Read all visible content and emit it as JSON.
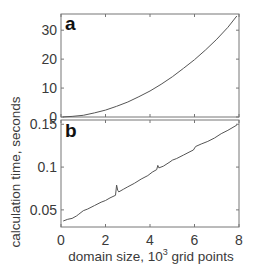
{
  "chart_data": [
    {
      "type": "line",
      "panel": "a",
      "title": "",
      "xlabel": "domain size, 10^3 grid points",
      "ylabel": "calculation time, seconds",
      "xlim": [
        0,
        8
      ],
      "ylim": [
        0,
        35.6
      ],
      "xticks": [
        0,
        2,
        4,
        6,
        8
      ],
      "yticks": [
        0,
        10,
        20,
        30
      ],
      "ytick_labels": [
        "0",
        "10",
        "20",
        "30"
      ],
      "grid": false,
      "series": [
        {
          "name": "calculation time",
          "x": [
            0.1,
            0.5,
            1,
            1.5,
            2,
            2.5,
            3,
            3.5,
            4,
            4.5,
            5,
            5.5,
            6,
            6.5,
            7,
            7.5,
            7.9
          ],
          "y": [
            0.05,
            0.2,
            0.6,
            1.4,
            2.4,
            3.7,
            5.2,
            7.0,
            9.0,
            11.3,
            13.9,
            16.8,
            19.8,
            23.2,
            26.9,
            31.0,
            34.9
          ]
        }
      ]
    },
    {
      "type": "line",
      "panel": "b",
      "title": "",
      "xlabel": "domain size, 10^3 grid points",
      "ylabel": "calculation time, seconds",
      "xlim": [
        0,
        8
      ],
      "ylim": [
        0.03,
        0.155
      ],
      "xticks": [
        0,
        2,
        4,
        6,
        8
      ],
      "xtick_labels": [
        "0",
        "2",
        "4",
        "6",
        "8"
      ],
      "yticks": [
        0.05,
        0.1,
        0.15
      ],
      "ytick_labels": [
        "0.05",
        "0.1",
        "0.15"
      ],
      "grid": false,
      "series": [
        {
          "name": "calculation time",
          "x": [
            0.1,
            0.3,
            0.5,
            0.7,
            0.8,
            1.0,
            1.2,
            1.5,
            1.8,
            2.0,
            2.2,
            2.45,
            2.5,
            2.55,
            2.6,
            2.8,
            3.0,
            3.3,
            3.6,
            3.9,
            4.1,
            4.3,
            4.35,
            4.4,
            4.6,
            4.9,
            5.0,
            5.2,
            5.5,
            5.8,
            5.95,
            6.05,
            6.3,
            6.6,
            6.9,
            7.2,
            7.5,
            7.9
          ],
          "y": [
            0.037,
            0.039,
            0.04,
            0.043,
            0.045,
            0.049,
            0.051,
            0.055,
            0.059,
            0.061,
            0.064,
            0.067,
            0.079,
            0.073,
            0.071,
            0.074,
            0.077,
            0.081,
            0.086,
            0.09,
            0.094,
            0.097,
            0.102,
            0.099,
            0.101,
            0.106,
            0.108,
            0.11,
            0.114,
            0.118,
            0.12,
            0.124,
            0.127,
            0.13,
            0.134,
            0.139,
            0.143,
            0.149
          ]
        }
      ]
    }
  ],
  "labels": {
    "panel_a": "a",
    "panel_b": "b",
    "ylabel": "calculation time, seconds",
    "xlabel_prefix": "domain size, 10",
    "xlabel_sup": "3",
    "xlabel_suffix": " grid points"
  },
  "colors": {
    "line": "#555555",
    "axis": "#777777",
    "text": "#3a3a3a"
  }
}
